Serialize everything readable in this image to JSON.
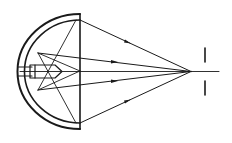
{
  "diagram": {
    "title": "",
    "type": "reflector-optics",
    "colors": {
      "stroke": "#1a1a1a",
      "background": "#ffffff"
    },
    "elements": [
      "reflector-outer-shell",
      "reflector-inner-surface",
      "aperture-plane-line",
      "lamp-bulb",
      "lamp-socket",
      "optical-axis",
      "light-rays",
      "focal-point",
      "aperture-slit"
    ],
    "labels": []
  }
}
